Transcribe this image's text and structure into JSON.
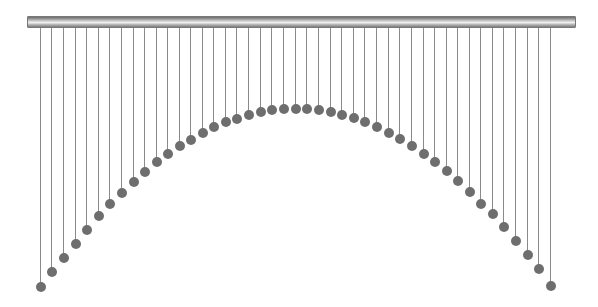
{
  "scene": {
    "title": "",
    "bar": {
      "x": 27,
      "y": 16,
      "width": 549,
      "height": 12
    },
    "string_top": 28,
    "bob_radius": 5,
    "colors": {
      "string": "#8a8a8a",
      "bob": "#6e6e6e",
      "bar_dark": "#5a5a5a",
      "bar_light": "#f2f2f2"
    },
    "pendulums": [
      {
        "x": 40,
        "y": 287
      },
      {
        "x": 51,
        "y": 272
      },
      {
        "x": 63,
        "y": 258
      },
      {
        "x": 75,
        "y": 244
      },
      {
        "x": 86,
        "y": 230
      },
      {
        "x": 98,
        "y": 216
      },
      {
        "x": 109,
        "y": 204
      },
      {
        "x": 121,
        "y": 193
      },
      {
        "x": 133,
        "y": 182
      },
      {
        "x": 144,
        "y": 172
      },
      {
        "x": 156,
        "y": 162
      },
      {
        "x": 167,
        "y": 154
      },
      {
        "x": 179,
        "y": 146
      },
      {
        "x": 190,
        "y": 140
      },
      {
        "x": 202,
        "y": 133
      },
      {
        "x": 213,
        "y": 127
      },
      {
        "x": 225,
        "y": 122
      },
      {
        "x": 236,
        "y": 119
      },
      {
        "x": 248,
        "y": 115
      },
      {
        "x": 260,
        "y": 112
      },
      {
        "x": 271,
        "y": 110
      },
      {
        "x": 283,
        "y": 109
      },
      {
        "x": 295,
        "y": 109
      },
      {
        "x": 306,
        "y": 109
      },
      {
        "x": 318,
        "y": 110
      },
      {
        "x": 330,
        "y": 112
      },
      {
        "x": 341,
        "y": 115
      },
      {
        "x": 353,
        "y": 118
      },
      {
        "x": 364,
        "y": 122
      },
      {
        "x": 376,
        "y": 127
      },
      {
        "x": 388,
        "y": 133
      },
      {
        "x": 399,
        "y": 139
      },
      {
        "x": 411,
        "y": 146
      },
      {
        "x": 423,
        "y": 154
      },
      {
        "x": 434,
        "y": 162
      },
      {
        "x": 446,
        "y": 171
      },
      {
        "x": 457,
        "y": 181
      },
      {
        "x": 469,
        "y": 192
      },
      {
        "x": 480,
        "y": 204
      },
      {
        "x": 492,
        "y": 214
      },
      {
        "x": 503,
        "y": 227
      },
      {
        "x": 515,
        "y": 241
      },
      {
        "x": 527,
        "y": 255
      },
      {
        "x": 538,
        "y": 269
      },
      {
        "x": 550,
        "y": 286
      }
    ]
  }
}
